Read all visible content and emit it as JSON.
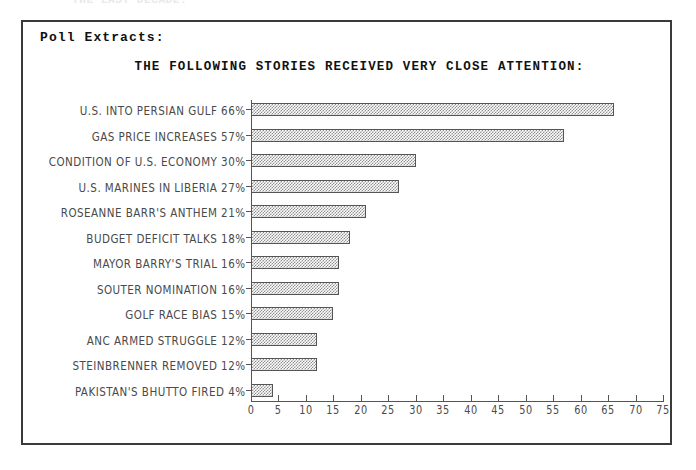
{
  "page": {
    "clipped_top_text": "THE LAST DECADE:"
  },
  "panel": {
    "header": "Poll Extracts:"
  },
  "colors": {
    "frame_border": "#3a3a3a",
    "axis": "#555555",
    "bar_fill": "#8f8f8f",
    "bar_outline": "#555555",
    "label_text": "#4a4a4a",
    "title_text": "#111111",
    "background": "#ffffff"
  },
  "chart_data": {
    "type": "bar",
    "orientation": "horizontal",
    "title": "THE FOLLOWING STORIES RECEIVED VERY CLOSE ATTENTION:",
    "xlabel": "",
    "ylabel": "",
    "xlim": [
      0,
      75
    ],
    "grid": false,
    "legend": null,
    "xticks": [
      0,
      5,
      10,
      15,
      20,
      25,
      30,
      35,
      40,
      45,
      50,
      55,
      60,
      65,
      70,
      75
    ],
    "xticklabels": [
      "0",
      "5",
      "10",
      "15",
      "20",
      "25",
      "30",
      "35",
      "40",
      "45",
      "50",
      "55",
      "60",
      "65",
      "70",
      "75"
    ],
    "categories": [
      "U.S. INTO PERSIAN GULF",
      "GAS PRICE INCREASES",
      "CONDITION OF U.S. ECONOMY",
      "U.S. MARINES IN LIBERIA",
      "ROSEANNE BARR'S ANTHEM",
      "BUDGET DEFICIT TALKS",
      "MAYOR BARRY'S TRIAL",
      "SOUTER NOMINATION",
      "GOLF RACE BIAS",
      "ANC ARMED STRUGGLE",
      "STEINBRENNER REMOVED",
      "PAKISTAN'S BHUTTO FIRED"
    ],
    "values": [
      66,
      57,
      30,
      27,
      21,
      18,
      16,
      16,
      15,
      12,
      12,
      4
    ],
    "value_labels": [
      "66%",
      "57%",
      "30%",
      "27%",
      "21%",
      "18%",
      "16%",
      "16%",
      "15%",
      "12%",
      "12%",
      "4%"
    ],
    "bars": [
      {
        "label": "U.S. INTO PERSIAN GULF",
        "value": 66,
        "display": "U.S. INTO PERSIAN GULF 66%"
      },
      {
        "label": "GAS PRICE INCREASES",
        "value": 57,
        "display": "GAS PRICE INCREASES 57%"
      },
      {
        "label": "CONDITION OF U.S. ECONOMY",
        "value": 30,
        "display": "CONDITION OF U.S. ECONOMY 30%"
      },
      {
        "label": "U.S. MARINES IN LIBERIA",
        "value": 27,
        "display": "U.S. MARINES IN LIBERIA 27%"
      },
      {
        "label": "ROSEANNE BARR'S ANTHEM",
        "value": 21,
        "display": "ROSEANNE BARR'S ANTHEM 21%"
      },
      {
        "label": "BUDGET DEFICIT TALKS",
        "value": 18,
        "display": "BUDGET DEFICIT TALKS 18%"
      },
      {
        "label": "MAYOR BARRY'S TRIAL",
        "value": 16,
        "display": "MAYOR BARRY'S TRIAL 16%"
      },
      {
        "label": "SOUTER NOMINATION",
        "value": 16,
        "display": "SOUTER NOMINATION 16%"
      },
      {
        "label": "GOLF RACE BIAS",
        "value": 15,
        "display": "GOLF RACE BIAS 15%"
      },
      {
        "label": "ANC ARMED STRUGGLE",
        "value": 12,
        "display": "ANC ARMED STRUGGLE 12%"
      },
      {
        "label": "STEINBRENNER REMOVED",
        "value": 12,
        "display": "STEINBRENNER REMOVED 12%"
      },
      {
        "label": "PAKISTAN'S BHUTTO FIRED",
        "value": 4,
        "display": "PAKISTAN'S BHUTTO FIRED 4%"
      }
    ]
  }
}
